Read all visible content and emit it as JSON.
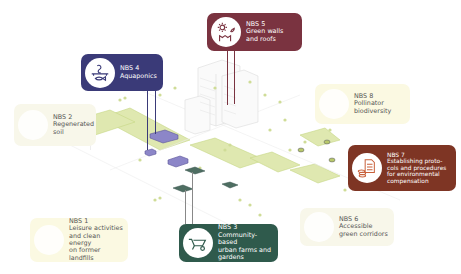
{
  "colors": {
    "nbs5": "#7a3340",
    "nbs4": "#3a3a78",
    "nbs3": "#2f5a4c",
    "nbs7": "#7e3524",
    "light_green": "#d5e29a",
    "light_box": "#f8f7ea",
    "light_box_yellow": "#fbf9e2",
    "purple_block": "#8c86c8",
    "teal_block": "#4e6e62"
  },
  "cards": [
    {
      "id": "nbs5",
      "number": "NBS 5",
      "label": "Green walls\nand roofs",
      "icon": "green-wall-icon",
      "style": "dark"
    },
    {
      "id": "nbs4",
      "number": "NBS 4",
      "label": "Aquaponics",
      "icon": "aquaponics-icon",
      "style": "dark"
    },
    {
      "id": "nbs2",
      "number": "NBS 2",
      "label": "Regenerated\nsoil",
      "icon": "soil-icon",
      "style": "light"
    },
    {
      "id": "nbs8",
      "number": "NBS 8",
      "label": "Pollinator\nbiodiversity",
      "icon": "bee-icon",
      "style": "light"
    },
    {
      "id": "nbs7",
      "number": "NBS 7",
      "label": "Establishing proto-\ncols and procedures\nfor environmental\ncompensation",
      "icon": "document-coins-icon",
      "style": "dark"
    },
    {
      "id": "nbs1",
      "number": "NBS 1",
      "label": "Leisure activities\nand clean energy\non former landfills",
      "icon": "landfill-icon",
      "style": "light"
    },
    {
      "id": "nbs3",
      "number": "NBS 3",
      "label": "Community-based\nurban farms and\ngardens",
      "icon": "wheelbarrow-icon",
      "style": "dark"
    },
    {
      "id": "nbs6",
      "number": "NBS 6",
      "label": "Accessible\ngreen corridors",
      "icon": "corridor-icon",
      "style": "light"
    }
  ]
}
